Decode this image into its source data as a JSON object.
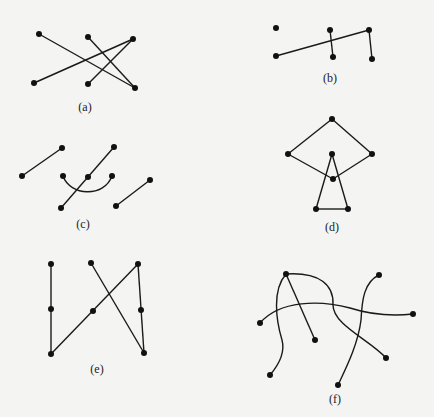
{
  "figure": {
    "background": "#f4f4f2",
    "ink": "#111111",
    "panels": [
      {
        "id": "a",
        "label": "(a)",
        "label_pos": [
          85,
          108
        ],
        "nodes": [
          [
            39,
            34
          ],
          [
            88,
            37
          ],
          [
            133,
            39
          ],
          [
            34,
            83
          ],
          [
            88,
            84
          ],
          [
            135,
            88
          ]
        ],
        "edges": [
          [
            0,
            5
          ],
          [
            1,
            5
          ],
          [
            3,
            2
          ],
          [
            4,
            2
          ]
        ],
        "curves": []
      },
      {
        "id": "b",
        "label": "(b)",
        "label_pos": [
          330,
          79
        ],
        "nodes": [
          [
            276,
            28
          ],
          [
            330,
            30
          ],
          [
            369,
            30
          ],
          [
            276,
            56
          ],
          [
            333,
            57
          ],
          [
            372,
            59
          ]
        ],
        "edges": [
          [
            3,
            2
          ],
          [
            1,
            4
          ],
          [
            2,
            5
          ]
        ],
        "curves": []
      },
      {
        "id": "c",
        "label": "(c)",
        "label_pos": [
          83,
          225
        ],
        "nodes": [
          [
            22,
            176
          ],
          [
            62,
            148
          ],
          [
            114,
            147
          ],
          [
            63,
            176
          ],
          [
            88,
            177
          ],
          [
            112,
            176
          ],
          [
            61,
            208
          ],
          [
            116,
            206
          ],
          [
            150,
            180
          ]
        ],
        "edges": [
          [
            0,
            1
          ],
          [
            2,
            6
          ],
          [
            7,
            8
          ]
        ],
        "curves": [
          "M63,176 C70,196 104,198 112,176"
        ]
      },
      {
        "id": "d",
        "label": "(d)",
        "label_pos": [
          332,
          228
        ],
        "nodes": [
          [
            332,
            119
          ],
          [
            288,
            154
          ],
          [
            372,
            154
          ],
          [
            332,
            154
          ],
          [
            333,
            179
          ],
          [
            316,
            209
          ],
          [
            348,
            209
          ]
        ],
        "edges": [
          [
            0,
            1
          ],
          [
            0,
            2
          ],
          [
            1,
            4
          ],
          [
            2,
            4
          ],
          [
            3,
            5
          ],
          [
            3,
            6
          ],
          [
            5,
            6
          ]
        ],
        "curves": []
      },
      {
        "id": "e",
        "label": "(e)",
        "label_pos": [
          97,
          370
        ],
        "nodes": [
          [
            51,
            264
          ],
          [
            91,
            263
          ],
          [
            138,
            264
          ],
          [
            51,
            309
          ],
          [
            93,
            311
          ],
          [
            141,
            310
          ],
          [
            51,
            354
          ],
          [
            144,
            353
          ]
        ],
        "edges": [
          [
            0,
            6
          ],
          [
            6,
            2
          ],
          [
            1,
            7
          ],
          [
            2,
            7
          ]
        ],
        "curves": []
      },
      {
        "id": "f",
        "label": "(f)",
        "label_pos": [
          335,
          400
        ],
        "nodes": [
          [
            286,
            274
          ],
          [
            379,
            275
          ],
          [
            260,
            323
          ],
          [
            413,
            314
          ],
          [
            315,
            340
          ],
          [
            270,
            375
          ],
          [
            386,
            358
          ],
          [
            338,
            385
          ]
        ],
        "edges": [
          [
            0,
            4
          ]
        ],
        "curves": [
          "M286,274 C272,290 276,320 282,340 C286,355 276,368 270,375",
          "M286,274 C320,272 334,285 333,305 C333,325 370,340 386,358",
          "M260,323 C280,300 320,300 350,308 C375,316 395,316 413,314",
          "M379,275 C364,282 362,300 361,320 C358,345 345,370 338,385"
        ]
      }
    ]
  }
}
